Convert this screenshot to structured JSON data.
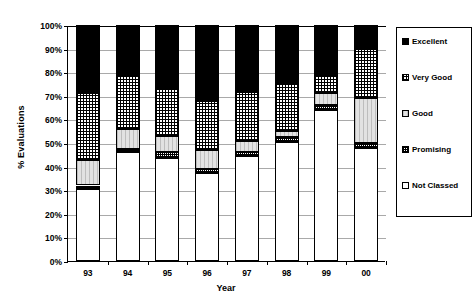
{
  "chart_data": {
    "type": "bar",
    "subtype": "stacked-percent",
    "title": "",
    "xlabel": "Year",
    "ylabel": "% Evaluations",
    "categories": [
      "93",
      "94",
      "95",
      "96",
      "97",
      "98",
      "99",
      "00"
    ],
    "ylim": [
      0,
      100
    ],
    "yticks": [
      "0%",
      "10%",
      "20%",
      "30%",
      "40%",
      "50%",
      "60%",
      "70%",
      "80%",
      "90%",
      "100%"
    ],
    "ytick_values": [
      0,
      10,
      20,
      30,
      40,
      50,
      60,
      70,
      80,
      90,
      100
    ],
    "grid": "horizontal",
    "legend_position": "right",
    "stack_order_bottom_to_top": [
      "Not Classed",
      "Promising",
      "Good",
      "Very Good",
      "Excellent"
    ],
    "series": [
      {
        "name": "Not Classed",
        "fill": "notclassed",
        "values": [
          30.5,
          46.0,
          43.5,
          37.5,
          44.5,
          50.5,
          64.0,
          48.0
        ]
      },
      {
        "name": "Promising",
        "fill": "promising",
        "values": [
          1.5,
          1.5,
          2.5,
          1.5,
          1.5,
          2.0,
          2.0,
          2.0
        ]
      },
      {
        "name": "Good",
        "fill": "good",
        "values": [
          11.0,
          8.5,
          7.0,
          8.0,
          5.0,
          2.5,
          5.0,
          19.0
        ]
      },
      {
        "name": "Very Good",
        "fill": "verygood",
        "values": [
          28.0,
          23.0,
          20.0,
          21.0,
          20.5,
          20.0,
          7.5,
          21.0
        ]
      },
      {
        "name": "Excellent",
        "fill": "excellent",
        "values": [
          29.0,
          21.0,
          27.0,
          32.0,
          28.5,
          25.0,
          21.5,
          10.0
        ]
      }
    ]
  },
  "legend": {
    "items": [
      {
        "label": "Excellent",
        "fill": "excellent"
      },
      {
        "label": "Very Good",
        "fill": "verygood"
      },
      {
        "label": "Good",
        "fill": "good"
      },
      {
        "label": "Promising",
        "fill": "promising"
      },
      {
        "label": "Not Classed",
        "fill": "notclassed"
      }
    ]
  },
  "colors": {
    "excellent": "#000000",
    "verygood": "#ffffff",
    "good": "#e2e2e2",
    "promising": "#ffffff",
    "notclassed": "#ffffff",
    "axis": "#000000",
    "gridline": "#a9a9a9"
  }
}
